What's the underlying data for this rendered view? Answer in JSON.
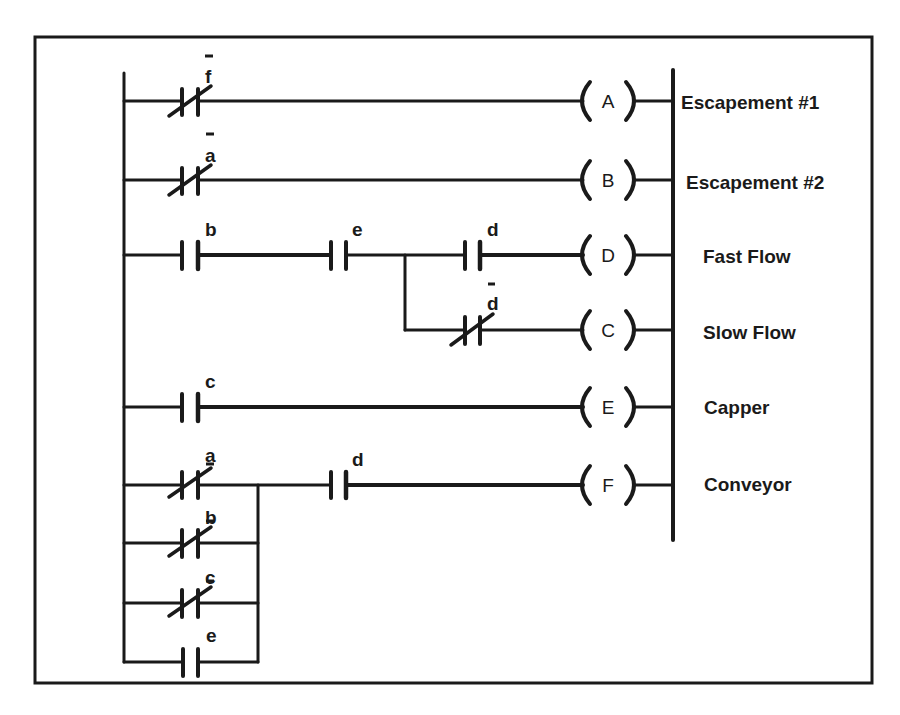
{
  "diagram": {
    "type": "ladder-logic",
    "colors": {
      "ink": "#1a1a1a",
      "background": "#ffffff"
    },
    "rungs": [
      {
        "id": "A",
        "coil": "A",
        "output_label": "Escapement #1",
        "contacts": [
          {
            "name": "f",
            "negated": true,
            "type": "normally-closed"
          }
        ]
      },
      {
        "id": "B",
        "coil": "B",
        "output_label": "Escapement #2",
        "contacts": [
          {
            "name": "a",
            "negated": true,
            "type": "normally-closed"
          }
        ]
      },
      {
        "id": "D",
        "coil": "D",
        "output_label": "Fast Flow",
        "contacts": [
          {
            "name": "b",
            "negated": false,
            "type": "normally-open"
          },
          {
            "name": "e",
            "negated": false,
            "type": "normally-open"
          },
          {
            "name": "d",
            "negated": false,
            "type": "normally-open"
          }
        ]
      },
      {
        "id": "C",
        "coil": "C",
        "output_label": "Slow Flow",
        "branch_from": "after e",
        "contacts": [
          {
            "name": "d",
            "negated": true,
            "type": "normally-closed"
          }
        ]
      },
      {
        "id": "E",
        "coil": "E",
        "output_label": "Capper",
        "contacts": [
          {
            "name": "c",
            "negated": false,
            "type": "normally-open"
          }
        ]
      },
      {
        "id": "F",
        "coil": "F",
        "output_label": "Conveyor",
        "parallel_contacts": [
          {
            "name": "a",
            "negated": true,
            "type": "normally-closed"
          },
          {
            "name": "b",
            "negated": true,
            "type": "normally-closed"
          },
          {
            "name": "c",
            "negated": true,
            "type": "normally-closed"
          },
          {
            "name": "e",
            "negated": false,
            "type": "normally-open"
          }
        ],
        "series_contacts": [
          {
            "name": "d",
            "negated": false,
            "type": "normally-open"
          }
        ]
      }
    ],
    "text": {
      "coils": {
        "A": "A",
        "B": "B",
        "D": "D",
        "C": "C",
        "E": "E",
        "F": "F"
      },
      "labels": {
        "A": "Escapement #1",
        "B": "Escapement #2",
        "D": "Fast Flow",
        "C": "Slow Flow",
        "E": "Capper",
        "F": "Conveyor"
      },
      "contacts": {
        "r1_f": "f",
        "r2_a": "a",
        "r3_b": "b",
        "r3_e": "e",
        "r3_d": "d",
        "r4_d": "d",
        "r5_c": "c",
        "r6_a": "a",
        "r6_d": "d",
        "r7_b": "b",
        "r8_c": "c",
        "r9_e": "e"
      }
    }
  }
}
